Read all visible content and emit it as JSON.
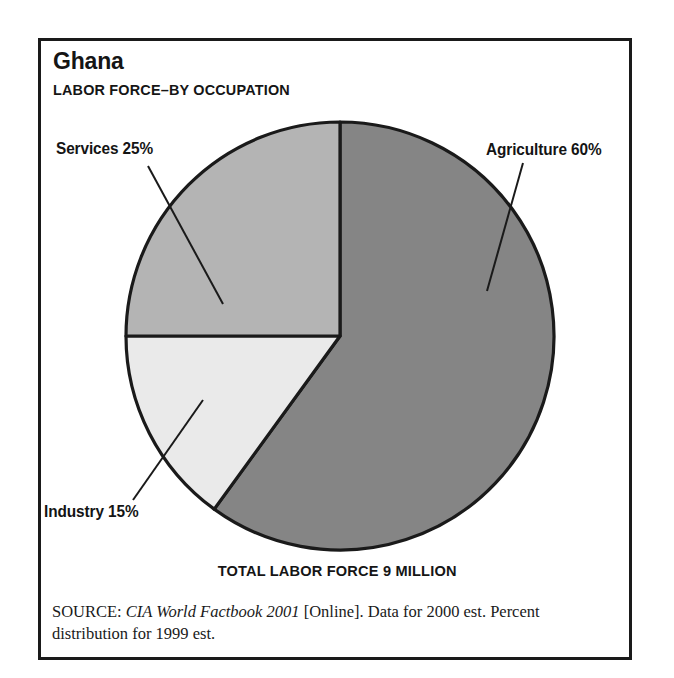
{
  "figure": {
    "title": "Ghana",
    "subtitle": "LABOR FORCE–BY OCCUPATION",
    "total_caption": "TOTAL LABOR FORCE 9 MILLION",
    "source": {
      "prefix": "SOURCE:",
      "publication": "CIA World Factbook 2001",
      "rest": "[Online]. Data for 2000 est. Percent distribution for 1999 est."
    }
  },
  "labels": {
    "services": "Services 25%",
    "agriculture": "Agriculture 60%",
    "industry": "Industry 15%"
  },
  "colors": {
    "agriculture": "#858585",
    "services": "#b4b4b4",
    "industry": "#eaeaea",
    "outline": "#1a1a1a",
    "frame": "#1a1a1a",
    "text": "#141414",
    "background": "#ffffff"
  },
  "chart_data": {
    "type": "pie",
    "subtitle": "LABOR FORCE–BY OCCUPATION",
    "categories": [
      "Agriculture",
      "Industry",
      "Services"
    ],
    "values": [
      60,
      15,
      25
    ],
    "value_unit": "percent",
    "labels": [
      "Agriculture 60%",
      "Industry 15%",
      "Services 25%"
    ],
    "slice_colors": [
      "#858585",
      "#eaeaea",
      "#b4b4b4"
    ],
    "start_angle_deg": 0,
    "direction": "clockwise",
    "slice_angles_deg": [
      216,
      54,
      90
    ],
    "annotations": [
      "TOTAL LABOR FORCE 9 MILLION"
    ],
    "total_labor_force": "9 million",
    "legend": "none (direct slice labels with leader lines)",
    "grid": false,
    "xlabel": "",
    "ylabel": ""
  }
}
